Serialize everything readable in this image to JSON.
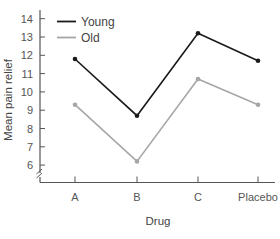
{
  "chart_data": {
    "type": "line",
    "title": "",
    "xlabel": "Drug",
    "ylabel": "Mean pain relief",
    "categories": [
      "A",
      "B",
      "C",
      "Placebo"
    ],
    "series": [
      {
        "name": "Young",
        "color": "#1a1a1a",
        "values": [
          11.8,
          8.7,
          13.2,
          11.7
        ]
      },
      {
        "name": "Old",
        "color": "#a6a6a6",
        "values": [
          9.3,
          6.2,
          10.7,
          9.3
        ]
      }
    ],
    "yticks": [
      6,
      7,
      8,
      9,
      10,
      11,
      12,
      13,
      14
    ],
    "ylim": [
      5,
      14.5
    ],
    "axis_break": true,
    "grid": false,
    "legend_position": "top-left"
  }
}
